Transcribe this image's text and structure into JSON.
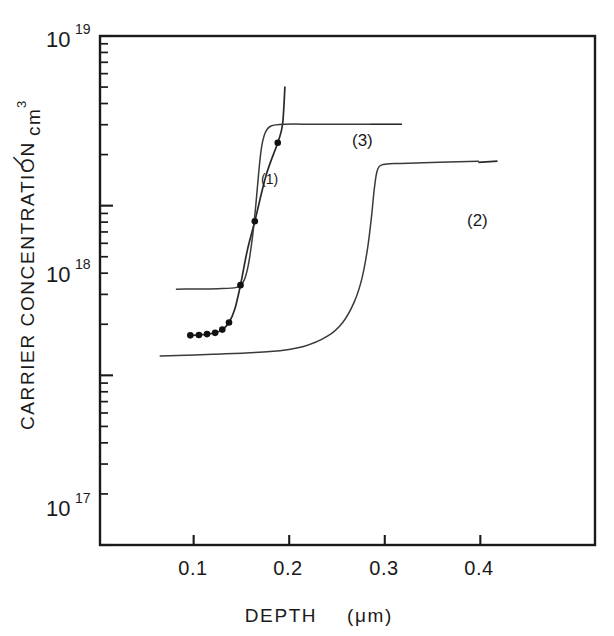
{
  "chart_data": {
    "type": "line",
    "title": "",
    "xlabel": "DEPTH (μm)",
    "ylabel": "CARRIER CONCENTRATION / cm",
    "ylabel_exponent": "3",
    "xlim": [
      0.002,
      0.52
    ],
    "ylim": [
      1e+16,
      1e+19
    ],
    "yscale": "log",
    "xscale": "linear",
    "grid": false,
    "legend": "inline-labels",
    "xticks": [
      0.1,
      0.2,
      0.3,
      0.4
    ],
    "xticklabels": [
      "0.1",
      "0.2",
      "0.3",
      "0.4"
    ],
    "yticks": [
      1e+17,
      1e+18,
      1e+19
    ],
    "yticklabels": [
      "10",
      "10",
      "10"
    ],
    "ytick_bases": [
      "10",
      "10",
      "10"
    ],
    "ytick_exponents": [
      "17",
      "18",
      "19"
    ],
    "series": [
      {
        "name": "(1)",
        "label": "(1)",
        "has_markers": true,
        "marker": "filled-circle",
        "label_x": 0.175,
        "label_y": 4.1e+18,
        "points": [
          [
            0.0965,
            1.72e+17
          ],
          [
            0.1055,
            1.73e+17
          ],
          [
            0.114,
            1.75e+17
          ],
          [
            0.1225,
            1.78e+17
          ],
          [
            0.13,
            1.86e+17
          ],
          [
            0.137,
            2.05e+17
          ],
          [
            0.143,
            2.45e+17
          ],
          [
            0.149,
            3.4e+17
          ],
          [
            0.156,
            5.4e+17
          ],
          [
            0.164,
            8.1e+17
          ],
          [
            0.176,
            1.52e+18
          ],
          [
            0.188,
            2.35e+18
          ],
          [
            0.193,
            3e+18
          ],
          [
            0.1955,
            5e+18
          ]
        ],
        "marker_points": [
          [
            0.0965,
            1.72e+17
          ],
          [
            0.1055,
            1.73e+17
          ],
          [
            0.114,
            1.75e+17
          ],
          [
            0.1225,
            1.78e+17
          ],
          [
            0.13,
            1.86e+17
          ],
          [
            0.137,
            2.05e+17
          ],
          [
            0.149,
            3.4e+17
          ],
          [
            0.164,
            8.1e+17
          ],
          [
            0.188,
            2.35e+18
          ]
        ]
      },
      {
        "name": "(2)",
        "label": "(2)",
        "has_markers": false,
        "label_x": 0.425,
        "label_y": 1.8e+18,
        "leader_from": [
          0.398,
          1.8e+18
        ],
        "leader_to": [
          0.418,
          1.83e+18
        ],
        "points": [
          [
            0.065,
            1.3e+17
          ],
          [
            0.12,
            1.33e+17
          ],
          [
            0.18,
            1.38e+17
          ],
          [
            0.215,
            1.48e+17
          ],
          [
            0.24,
            1.7e+17
          ],
          [
            0.256,
            2.05e+17
          ],
          [
            0.268,
            2.7e+17
          ],
          [
            0.276,
            3.7e+17
          ],
          [
            0.282,
            5.6e+17
          ],
          [
            0.286,
            8.5e+17
          ],
          [
            0.289,
            1.25e+18
          ],
          [
            0.292,
            1.6e+18
          ],
          [
            0.297,
            1.74e+18
          ],
          [
            0.31,
            1.77e+18
          ],
          [
            0.34,
            1.79e+18
          ],
          [
            0.398,
            1.83e+18
          ]
        ]
      },
      {
        "name": "(3)",
        "label": "(3)",
        "has_markers": false,
        "label_x": 0.325,
        "label_y": 3.15e+18,
        "leader_from": [
          0.285,
          3.02e+18
        ],
        "leader_to": [
          0.318,
          3.02e+18
        ],
        "points": [
          [
            0.082,
            3.22e+17
          ],
          [
            0.125,
            3.24e+17
          ],
          [
            0.145,
            3.3e+17
          ],
          [
            0.152,
            3.55e+17
          ],
          [
            0.157,
            4.4e+17
          ],
          [
            0.1615,
            6.5e+17
          ],
          [
            0.165,
            1e+18
          ],
          [
            0.168,
            1.55e+18
          ],
          [
            0.171,
            2.2e+18
          ],
          [
            0.175,
            2.7e+18
          ],
          [
            0.181,
            2.95e+18
          ],
          [
            0.195,
            3.02e+18
          ],
          [
            0.23,
            3.02e+18
          ],
          [
            0.285,
            3.02e+18
          ]
        ]
      }
    ],
    "annotations": [
      {
        "text": "(1)",
        "x": 0.175,
        "y": 4.1e+18
      },
      {
        "text": "(2)",
        "x": 0.425,
        "y": 1.8e+18
      },
      {
        "text": "(3)",
        "x": 0.325,
        "y": 3.15e+18
      }
    ]
  },
  "axes": {
    "y_title_main": "CARRIER  CONCENTRATION",
    "y_title_slash": "/",
    "y_title_unit": "cm",
    "y_title_unit_exp": "3",
    "x_title": "DEPTH",
    "x_title_unit": "(μm)",
    "x_tick_1": "0.1",
    "x_tick_2": "0.2",
    "x_tick_3": "0.3",
    "x_tick_4": "0.4",
    "y_dec_19_base": "10",
    "y_dec_19_exp": "19",
    "y_dec_18_base": "10",
    "y_dec_18_exp": "18",
    "y_dec_17_base": "10",
    "y_dec_17_exp": "17"
  },
  "labels": {
    "curve1": "(1)",
    "curve2": "(2)",
    "curve3": "(3)"
  },
  "colors": {
    "ink": "#1a1a1a",
    "curve": "#2a2a2a",
    "background": "#ffffff"
  }
}
